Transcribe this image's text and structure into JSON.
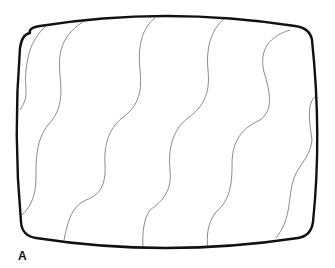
{
  "figure": {
    "panel_label": "A",
    "colors": {
      "outline": "#111111",
      "wave": "#8a8a8a",
      "background": "#ffffff"
    },
    "wave_count": 6
  }
}
